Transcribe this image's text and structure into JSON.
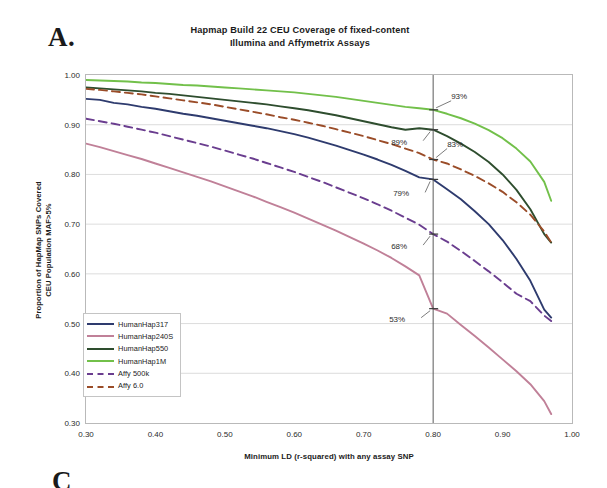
{
  "figure": {
    "panel_letter": "A.",
    "next_panel_letter": "C"
  },
  "chart_data": {
    "type": "line",
    "title": "Hapmap Build 22 CEU Coverage of fixed-content Illumina and Affymetrix Assays",
    "title_line1": "Hapmap Build 22 CEU Coverage of fixed-content",
    "title_line2": "Illumina and Affymetrix Assays",
    "xlabel": "Minimum LD (r-squared) with any assay SNP",
    "ylabel": "Proportion of HapMap SNPs  Covered CEU Population MAF>5%",
    "ylabel_line1": "Proportion of HapMap SNPs  Covered",
    "ylabel_line2": "CEU Population MAF>5%",
    "xlim": [
      0.3,
      1.0
    ],
    "ylim": [
      0.3,
      1.0
    ],
    "xticks": [
      0.3,
      0.4,
      0.5,
      0.6,
      0.7,
      0.8,
      0.9,
      1.0
    ],
    "xticklabels": [
      "0.30",
      "0.40",
      "0.50",
      "0.60",
      "0.70",
      "0.80",
      "0.90",
      "1.00"
    ],
    "yticks": [
      0.3,
      0.4,
      0.5,
      0.6,
      0.7,
      0.8,
      0.9,
      1.0
    ],
    "yticklabels": [
      "0.30",
      "0.40",
      "0.50",
      "0.60",
      "0.70",
      "0.80",
      "0.90",
      "1.00"
    ],
    "grid": "horizontal",
    "legend_position": "lower-left-inside",
    "reference_line_x": 0.8,
    "x": [
      0.3,
      0.32,
      0.34,
      0.36,
      0.38,
      0.4,
      0.42,
      0.44,
      0.46,
      0.48,
      0.5,
      0.52,
      0.54,
      0.56,
      0.58,
      0.6,
      0.62,
      0.64,
      0.66,
      0.68,
      0.7,
      0.72,
      0.74,
      0.76,
      0.78,
      0.8,
      0.82,
      0.84,
      0.86,
      0.88,
      0.9,
      0.92,
      0.94,
      0.96,
      0.97
    ],
    "series": [
      {
        "name": "HumanHap317",
        "color": "#2e3b6e",
        "style": "solid",
        "values": [
          0.952,
          0.95,
          0.944,
          0.941,
          0.936,
          0.932,
          0.927,
          0.922,
          0.918,
          0.913,
          0.908,
          0.903,
          0.898,
          0.893,
          0.887,
          0.881,
          0.874,
          0.866,
          0.858,
          0.849,
          0.84,
          0.83,
          0.819,
          0.807,
          0.794,
          0.79,
          0.77,
          0.75,
          0.726,
          0.7,
          0.668,
          0.63,
          0.586,
          0.528,
          0.512
        ]
      },
      {
        "name": "HumanHap240S",
        "color": "#c08098",
        "style": "solid",
        "values": [
          0.862,
          0.855,
          0.847,
          0.839,
          0.831,
          0.822,
          0.813,
          0.804,
          0.795,
          0.786,
          0.776,
          0.766,
          0.756,
          0.745,
          0.734,
          0.723,
          0.711,
          0.699,
          0.687,
          0.674,
          0.661,
          0.647,
          0.632,
          0.615,
          0.597,
          0.53,
          0.52,
          0.497,
          0.475,
          0.452,
          0.428,
          0.404,
          0.378,
          0.344,
          0.318
        ]
      },
      {
        "name": "HumanHap550",
        "color": "#2e4d2e",
        "style": "solid",
        "values": [
          0.975,
          0.973,
          0.971,
          0.969,
          0.967,
          0.964,
          0.962,
          0.959,
          0.956,
          0.953,
          0.95,
          0.947,
          0.944,
          0.941,
          0.937,
          0.933,
          0.929,
          0.924,
          0.919,
          0.913,
          0.907,
          0.901,
          0.895,
          0.89,
          0.893,
          0.89,
          0.877,
          0.862,
          0.845,
          0.825,
          0.8,
          0.769,
          0.73,
          0.68,
          0.663
        ]
      },
      {
        "name": "HumanHap1M",
        "color": "#72c04a",
        "style": "solid",
        "values": [
          0.99,
          0.989,
          0.988,
          0.987,
          0.985,
          0.984,
          0.982,
          0.98,
          0.979,
          0.977,
          0.975,
          0.973,
          0.971,
          0.969,
          0.967,
          0.965,
          0.962,
          0.959,
          0.956,
          0.952,
          0.948,
          0.944,
          0.94,
          0.936,
          0.933,
          0.93,
          0.922,
          0.913,
          0.902,
          0.889,
          0.873,
          0.852,
          0.826,
          0.785,
          0.747
        ]
      },
      {
        "name": "Affy 500k",
        "color": "#6a3d8f",
        "style": "dashed",
        "values": [
          0.912,
          0.907,
          0.902,
          0.896,
          0.89,
          0.884,
          0.877,
          0.87,
          0.863,
          0.856,
          0.848,
          0.84,
          0.832,
          0.823,
          0.814,
          0.805,
          0.795,
          0.785,
          0.774,
          0.763,
          0.752,
          0.74,
          0.727,
          0.713,
          0.699,
          0.68,
          0.665,
          0.646,
          0.626,
          0.605,
          0.583,
          0.56,
          0.545,
          0.516,
          0.505
        ]
      },
      {
        "name": "Affy 6.0",
        "color": "#9a4c28",
        "style": "dashed",
        "values": [
          0.972,
          0.97,
          0.967,
          0.964,
          0.961,
          0.957,
          0.953,
          0.949,
          0.945,
          0.941,
          0.936,
          0.931,
          0.926,
          0.921,
          0.915,
          0.91,
          0.904,
          0.898,
          0.891,
          0.884,
          0.877,
          0.869,
          0.861,
          0.852,
          0.843,
          0.83,
          0.822,
          0.81,
          0.797,
          0.782,
          0.765,
          0.744,
          0.719,
          0.685,
          0.663
        ]
      }
    ],
    "annotations": [
      {
        "label": "93%",
        "series": "HumanHap1M",
        "x": 0.8,
        "y": 0.93
      },
      {
        "label": "89%",
        "series": "HumanHap550",
        "x": 0.8,
        "y": 0.89
      },
      {
        "label": "83%",
        "series": "Affy 6.0",
        "x": 0.8,
        "y": 0.83
      },
      {
        "label": "79%",
        "series": "HumanHap317",
        "x": 0.8,
        "y": 0.79
      },
      {
        "label": "68%",
        "series": "Affy 500k",
        "x": 0.8,
        "y": 0.68
      },
      {
        "label": "53%",
        "series": "HumanHap240S",
        "x": 0.8,
        "y": 0.53
      }
    ]
  }
}
